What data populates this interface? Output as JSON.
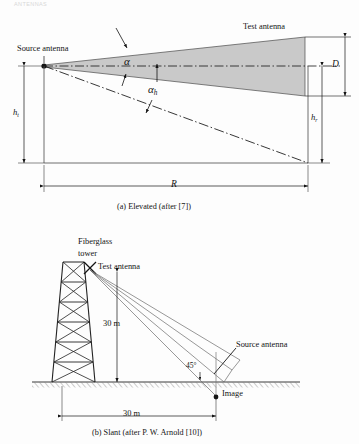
{
  "page": {
    "running_header": "ANTENNAS",
    "background_color": "#fdfdfd",
    "ink_color": "#141414",
    "beam_fill_color": "#c9c9c9",
    "width": 359,
    "height": 444
  },
  "figure_a": {
    "caption": "(a) Elevated (after [7])",
    "labels": {
      "source_antenna": "Source antenna",
      "test_antenna": "Test antenna",
      "alpha": "α",
      "alpha_h_base": "α",
      "alpha_h_sub": "h",
      "aperture_D": "D",
      "height_t_base": "h",
      "height_t_sub": "t",
      "height_r_base": "h",
      "height_r_sub": "r",
      "range_R": "R"
    }
  },
  "figure_b": {
    "caption": "(b) Slant (after P. W. Arnold [10])",
    "labels": {
      "fiberglass_tower_line1": "Fiberglass",
      "fiberglass_tower_line2": "tower",
      "test_antenna": "Test antenna",
      "source_antenna": "Source antenna",
      "image": "Image",
      "tower_height": "30 m",
      "ground_distance": "30 m",
      "angle": "45°"
    }
  }
}
